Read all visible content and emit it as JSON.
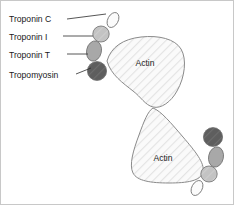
{
  "figure": {
    "width": 234,
    "height": 205,
    "background": "#ffffff",
    "border_color": "#c8c8c8"
  },
  "labels": [
    {
      "id": "troponin-c",
      "text": "Troponin C",
      "x": 8,
      "y": 21
    },
    {
      "id": "troponin-i",
      "text": "Troponin I",
      "x": 8,
      "y": 39
    },
    {
      "id": "troponin-t",
      "text": "Troponin T",
      "x": 8,
      "y": 57
    },
    {
      "id": "tropomyosin",
      "text": "Tropomyosin",
      "x": 8,
      "y": 76
    }
  ],
  "leader_lines": [
    {
      "id": "leader-troponin-c",
      "x1": 66,
      "y1": 18,
      "x2": 103,
      "y2": 14
    },
    {
      "id": "leader-troponin-i",
      "x1": 62,
      "y1": 36,
      "x2": 92,
      "y2": 36
    },
    {
      "id": "leader-troponin-t",
      "x1": 66,
      "y1": 54,
      "x2": 88,
      "y2": 54
    },
    {
      "id": "leader-tropomyosin",
      "x1": 72,
      "y1": 73,
      "x2": 92,
      "y2": 68
    }
  ],
  "actin_units": [
    {
      "id": "actin-upper",
      "label": "Actin",
      "label_x": 144,
      "label_y": 65
    },
    {
      "id": "actin-lower",
      "label": "Actin",
      "label_x": 160,
      "label_y": 157
    }
  ],
  "proteins": {
    "troponin_c": {
      "name": "Troponin C",
      "color": "#fbfbfb"
    },
    "troponin_i": {
      "name": "Troponin I",
      "color": "#c3c3c3"
    },
    "troponin_t": {
      "name": "Troponin T",
      "color": "#a8a8a8"
    },
    "tropomyosin": {
      "name": "Tropomyosin",
      "color": "#5e5e5e"
    },
    "actin_fill": {
      "name": "Actin",
      "color": "#fafafa"
    },
    "actin_hatch": {
      "name": "Actin hatch",
      "color": "#e2e2e2"
    },
    "outline": {
      "name": "Outline",
      "color": "#8a8a8a"
    }
  },
  "complexes": [
    {
      "id": "complex-upper",
      "troponin_c": {
        "cx": 112,
        "cy": 19,
        "rx": 5.2,
        "ry": 8.0,
        "rotate": 28
      },
      "troponin_i": {
        "cx": 100,
        "cy": 33,
        "rx": 8.2,
        "ry": 8.0,
        "rotate": 0
      },
      "troponin_t": {
        "cx": 93,
        "cy": 50,
        "rx": 7.4,
        "ry": 10.2,
        "rotate": 12
      },
      "tropomyosin": {
        "cx": 96,
        "cy": 70,
        "rx": 9.6,
        "ry": 9.4,
        "rotate": 0
      }
    },
    {
      "id": "complex-lower",
      "troponin_c": {
        "cx": 196,
        "cy": 184,
        "rx": 5.2,
        "ry": 8.0,
        "rotate": 28
      },
      "troponin_i": {
        "cx": 208,
        "cy": 171,
        "rx": 8.2,
        "ry": 8.0,
        "rotate": 0
      },
      "troponin_t": {
        "cx": 215,
        "cy": 155,
        "rx": 7.4,
        "ry": 10.2,
        "rotate": 12
      },
      "tropomyosin": {
        "cx": 212,
        "cy": 136,
        "rx": 9.6,
        "ry": 9.4,
        "rotate": 0
      }
    }
  ]
}
